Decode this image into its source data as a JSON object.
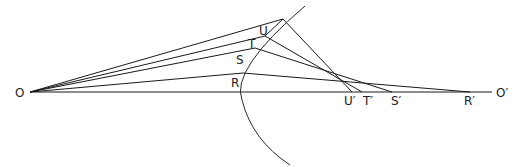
{
  "diagram": {
    "labels": {
      "O": "O",
      "O_prime": "O′",
      "R": "R",
      "S": "S",
      "T": "T",
      "U": "U",
      "R_prime": "R′",
      "S_prime": "S′",
      "T_prime": "T′",
      "U_prime": "U′"
    },
    "points": {
      "O": [
        30,
        92
      ],
      "R": [
        243,
        73
      ],
      "S": [
        246,
        49
      ],
      "T": [
        256,
        39
      ],
      "U": [
        266,
        33
      ],
      "V": [
        283,
        19
      ],
      "R_prime": [
        470,
        92
      ],
      "S_prime": [
        392,
        92
      ],
      "T_prime": [
        362,
        92
      ],
      "U_prime": [
        352,
        92
      ],
      "axis_end": [
        492,
        92
      ]
    },
    "colors": {
      "line": "#1a1a1a",
      "background": "#ffffff"
    }
  }
}
